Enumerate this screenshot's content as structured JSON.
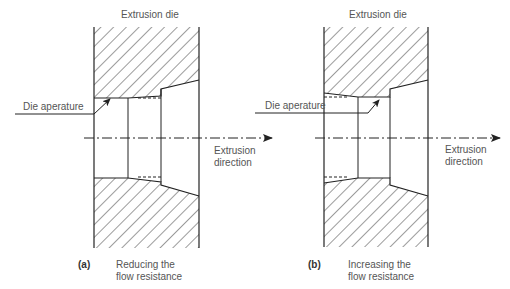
{
  "figure": {
    "panels": [
      {
        "id": "a",
        "tag": "(a)",
        "title_label": "Extrusion die",
        "aperture_label": "Die aperature",
        "direction_label_line1": "Extrusion",
        "direction_label_line2": "direction",
        "caption_line1": "Reducing the",
        "caption_line2": "flow resistance"
      },
      {
        "id": "b",
        "tag": "(b)",
        "title_label": "Extrusion die",
        "aperture_label": "Die aperature",
        "direction_label_line1": "Extrusion",
        "direction_label_line2": "direction",
        "caption_line1": "Increasing the",
        "caption_line2": "flow resistance"
      }
    ],
    "colors": {
      "line": "#222222",
      "text": "#555555",
      "background": "#ffffff"
    }
  }
}
